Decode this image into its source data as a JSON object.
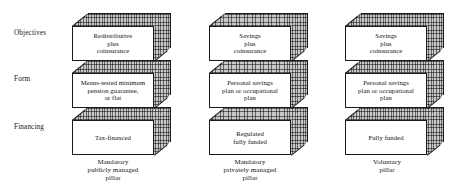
{
  "figure": {
    "row_labels": [
      {
        "id": "objectives",
        "label": "Objectives"
      },
      {
        "id": "form",
        "label": "Form"
      },
      {
        "id": "financing",
        "label": "Financing"
      }
    ],
    "columns": [
      {
        "id": "mandatory-publicly-managed-pillar",
        "caption": "Mandatory\npublicly managed\npillar",
        "cells": {
          "objectives": "Redistributive\nplus\ncoinsurance",
          "form": "Means-tested minimum\npension guarantee,\nor flat",
          "financing": "Tax-financed"
        }
      },
      {
        "id": "mandatory-privately-managed-pillar",
        "caption": "Mandatory\nprivately managed\npillar",
        "cells": {
          "objectives": "Savings\nplus\ncoinsurance",
          "form": "Personal savings\nplan or occupational\nplan",
          "financing": "Regulated\nfully funded"
        }
      },
      {
        "id": "voluntary-pillar",
        "caption": "Voluntary\npillar",
        "cells": {
          "objectives": "Savings\nplus\ncoinsurance",
          "form": "Personal savings\nplan or occupational\nplan",
          "financing": "Fully funded"
        }
      }
    ],
    "colors": {
      "box_face": "#ffffff",
      "box_shade": "#c9c9c9",
      "outline": "#1a1a1a",
      "background": "#ffffff",
      "text": "#111111"
    }
  }
}
